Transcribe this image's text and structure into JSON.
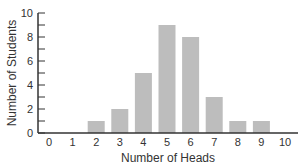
{
  "chart_data": {
    "type": "bar",
    "title": "",
    "xlabel": "Number of Heads",
    "ylabel": "Number of Students",
    "categories": [
      "0",
      "1",
      "2",
      "3",
      "4",
      "5",
      "6",
      "7",
      "8",
      "9",
      "10"
    ],
    "values": [
      0,
      0,
      1,
      2,
      5,
      9,
      8,
      3,
      1,
      1,
      0
    ],
    "ylim": [
      0,
      10
    ],
    "yticks_major": [
      0,
      2,
      4,
      6,
      8,
      10
    ],
    "yticks_minor": [
      1,
      3,
      5,
      7,
      9
    ],
    "grid": false,
    "legend": null,
    "bar_color": "#bdbdbd",
    "axis_color": "#333333"
  }
}
